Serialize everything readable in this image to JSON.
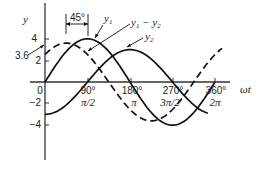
{
  "chart_data": {
    "type": "line",
    "title": "",
    "xlabel": "ωt",
    "ylabel": "y",
    "xlim": [
      0,
      370
    ],
    "ylim": [
      -6.5,
      7
    ],
    "grid": false,
    "x_ticks": [
      {
        "deg": 0,
        "label": "0",
        "rad_label": ""
      },
      {
        "deg": 90,
        "label": "90°",
        "rad_label": "π/2"
      },
      {
        "deg": 180,
        "label": "180°",
        "rad_label": "π"
      },
      {
        "deg": 270,
        "label": "270°",
        "rad_label": "3π/2"
      },
      {
        "deg": 360,
        "label": "360°",
        "rad_label": "2π"
      }
    ],
    "y_ticks": [
      4,
      2,
      -2,
      -4
    ],
    "series": [
      {
        "name": "y1",
        "style": "solid",
        "amplitude": 4,
        "phase_deg": 0,
        "x_range": [
          0,
          360
        ],
        "x": [
          0,
          45,
          90,
          135,
          180,
          225,
          270,
          315,
          360
        ],
        "values": [
          0,
          2.83,
          4,
          2.83,
          0,
          -2.83,
          -4,
          -2.83,
          0
        ]
      },
      {
        "name": "y2",
        "style": "solid",
        "amplitude": 3,
        "phase_deg": -90,
        "x_range": [
          0,
          345
        ],
        "x": [
          0,
          45,
          90,
          135,
          180,
          225,
          270,
          315
        ],
        "values": [
          -3,
          -2.12,
          0,
          2.12,
          3,
          2.12,
          0,
          -2.12
        ]
      },
      {
        "name": "y1 - y2",
        "style": "dashed",
        "amplitude": 3.6,
        "phase_deg": 45,
        "x_range": [
          0,
          375
        ],
        "x": [
          0,
          45,
          90,
          135,
          180,
          225,
          270,
          315,
          360
        ],
        "values": [
          2.55,
          3.6,
          2.55,
          0,
          -2.55,
          -3.6,
          -2.55,
          0,
          2.55
        ]
      }
    ],
    "annotations": [
      {
        "text": "45°",
        "type": "bracket",
        "from_deg": 45,
        "to_deg": 90
      },
      {
        "text": "3.6",
        "type": "leader",
        "target": "y1 - y2 peak value"
      },
      {
        "text": "y1",
        "type": "leader",
        "target": "y1"
      },
      {
        "text": "y1 - y2",
        "type": "leader",
        "target": "y1 - y2"
      },
      {
        "text": "y2",
        "type": "leader",
        "target": "y2"
      }
    ]
  },
  "labels": {
    "y_axis": "y",
    "x_axis": "ωt",
    "peak_value": "3.6",
    "phase_bracket": "45°",
    "legend_y1": "y",
    "legend_y1_sub": "1",
    "legend_diff_a": "y",
    "legend_diff_a_sub": "1",
    "legend_diff_minus": " − ",
    "legend_diff_b": "y",
    "legend_diff_b_sub": "2",
    "legend_y2": "y",
    "legend_y2_sub": "2",
    "y_tick_4": "4",
    "y_tick_2": "2",
    "y_tick_m2": "−2",
    "y_tick_m4": "−4",
    "x_tick_0": "0",
    "x_tick_90": "90°",
    "x_tick_180": "180°",
    "x_tick_270": "270°",
    "x_tick_360": "360°",
    "x_rad_90": "π/2",
    "x_rad_180": "π",
    "x_rad_270": "3π/2",
    "x_rad_360": "2π"
  }
}
